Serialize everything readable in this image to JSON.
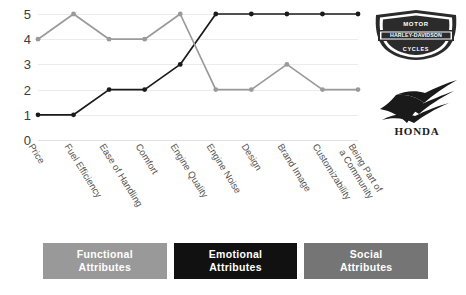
{
  "chart_data": {
    "type": "line",
    "title": "",
    "xlabel": "",
    "ylabel": "",
    "ylim": [
      0,
      5
    ],
    "yticks": [
      "0",
      "1",
      "2",
      "3",
      "4",
      "5"
    ],
    "grid": true,
    "legend_position": "bottom",
    "categories": [
      "Price",
      "Fuel Efficiency",
      "Ease of Handling",
      "Comfort",
      "Engine Quality",
      "Engine Noise",
      "Design",
      "Brand Image",
      "Customizability",
      "Being Part of\na Community"
    ],
    "series": [
      {
        "name": "Harley-Davidson",
        "color": "#1a1a1a",
        "values": [
          1,
          1,
          2,
          2,
          3,
          5,
          5,
          5,
          5,
          5
        ]
      },
      {
        "name": "Honda",
        "color": "#9a9a9a",
        "values": [
          4,
          5,
          4,
          4,
          5,
          2,
          2,
          3,
          2,
          2
        ]
      }
    ]
  },
  "legend": {
    "groups": [
      {
        "label": "Functional\nAttributes",
        "color": "#999999",
        "text_color": "#ffffff"
      },
      {
        "label": "Emotional\nAttributes",
        "color": "#111111",
        "text_color": "#ffffff"
      },
      {
        "label": "Social\nAttributes",
        "color": "#757575",
        "text_color": "#ffffff"
      }
    ]
  },
  "logos": {
    "harley": {
      "top_text": "MOTOR",
      "center_text": "HARLEY-DAVIDSON",
      "bottom_text": "CYCLES"
    },
    "honda": {
      "wordmark": "HONDA"
    }
  }
}
